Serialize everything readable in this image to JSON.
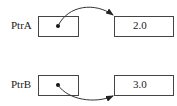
{
  "pointers": [
    {
      "name": "PtrA",
      "value": "2.0"
    },
    {
      "name": "PtrB",
      "value": "3.0"
    }
  ],
  "colors": {
    "line": "#333333",
    "background": "#ffffff"
  }
}
